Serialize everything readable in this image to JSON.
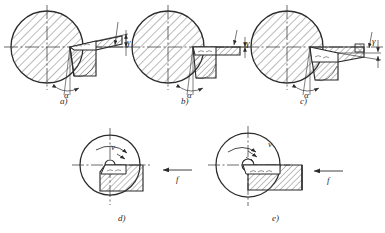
{
  "figure": {
    "type": "engineering-diagram",
    "background_color": "#ffffff",
    "line_color": "#2b2b2b",
    "hatch_color": "#6e6e6e"
  },
  "panels": [
    {
      "id": "a",
      "caption": "a)",
      "rake_angle_label": "γ",
      "clearance_angle_label": "α",
      "rake_sign": "positive",
      "circle": {
        "cx": 47,
        "cy": 47,
        "r": 36
      },
      "caption_pos": {
        "x": 60,
        "y": 104
      }
    },
    {
      "id": "b",
      "caption": "b)",
      "rake_angle_label": "γ",
      "clearance_angle_label": "α",
      "rake_sign": "zero",
      "circle": {
        "cx": 168,
        "cy": 47,
        "r": 36
      },
      "caption_pos": {
        "x": 181,
        "y": 104
      }
    },
    {
      "id": "c",
      "caption": "c)",
      "rake_angle_label": "γ",
      "clearance_angle_label": "α",
      "rake_sign": "negative",
      "circle": {
        "cx": 287,
        "cy": 47,
        "r": 36
      },
      "caption_pos": {
        "x": 300,
        "y": 104
      }
    },
    {
      "id": "d",
      "caption": "d)",
      "velocity_label": "v",
      "feed_label": "f",
      "circle": {
        "cx": 110,
        "cy": 165,
        "r": 30
      },
      "caption_pos": {
        "x": 118,
        "y": 221
      }
    },
    {
      "id": "e",
      "caption": "e)",
      "velocity_label": "v",
      "feed_label": "f",
      "circle": {
        "cx": 248,
        "cy": 165,
        "r": 32
      },
      "caption_pos": {
        "x": 272,
        "y": 221
      }
    }
  ],
  "symbols": {
    "gamma": "γ",
    "alpha": "α",
    "velocity": "v",
    "feed": "f"
  }
}
